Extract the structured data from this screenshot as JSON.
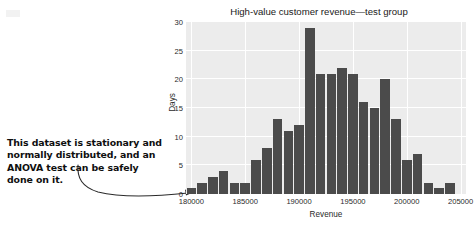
{
  "annotation": {
    "text": "This dataset is stationary and normally distributed, and an ANOVA test can be safely done on it.",
    "arrow_name": "curved-arrow-to-axis"
  },
  "chart_data": {
    "type": "bar",
    "title": "High-value customer revenue—test group",
    "xlabel": "Revenue",
    "ylabel": "Days",
    "xlim": [
      179500,
      205500
    ],
    "ylim": [
      0,
      30
    ],
    "grid": true,
    "legend": null,
    "bin_width": 1000,
    "xticks": [
      180000,
      185000,
      190000,
      195000,
      200000,
      205000
    ],
    "xtick_labels": [
      "180000",
      "185000",
      "190000",
      "195000",
      "200000",
      "205000"
    ],
    "yticks": [
      0,
      5,
      10,
      15,
      20,
      25,
      30
    ],
    "ytick_labels": [
      "0",
      "5",
      "10",
      "15",
      "20",
      "25",
      "30"
    ],
    "bar_color": "#4b4b4b",
    "plot_bg": "#ececec",
    "categories": [
      "179500-180500",
      "180500-181500",
      "181500-182500",
      "182500-183500",
      "183500-184500",
      "184500-185500",
      "185500-186500",
      "186500-187500",
      "187500-188500",
      "188500-189500",
      "189500-190500",
      "190500-191500",
      "191500-192500",
      "192500-193500",
      "193500-194500",
      "194500-195500",
      "195500-196500",
      "196500-197500",
      "197500-198500",
      "198500-199500",
      "199500-200500",
      "200500-201500",
      "201500-202500",
      "202500-203500",
      "203500-204500"
    ],
    "x": [
      180000,
      181000,
      182000,
      183000,
      184000,
      185000,
      186000,
      187000,
      188000,
      189000,
      190000,
      191000,
      192000,
      193000,
      194000,
      195000,
      196000,
      197000,
      198000,
      199000,
      200000,
      201000,
      202000,
      203000,
      204000
    ],
    "values": [
      1,
      2,
      3,
      4,
      2,
      2,
      6,
      8,
      13,
      11,
      12,
      29,
      21,
      21,
      22,
      21,
      16,
      15,
      20,
      13,
      6,
      7,
      2,
      1,
      2
    ]
  }
}
